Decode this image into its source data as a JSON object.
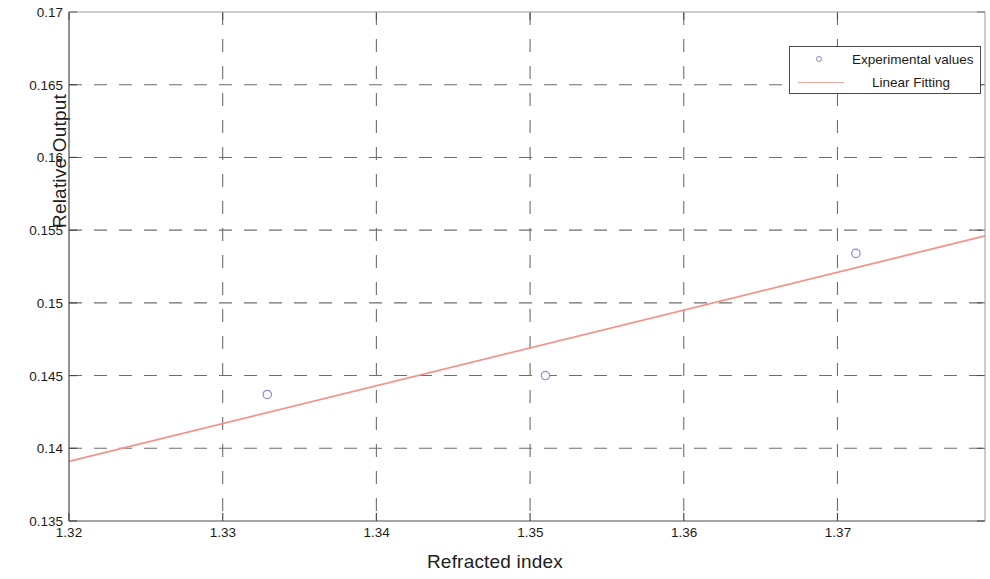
{
  "chart_data": {
    "type": "scatter",
    "title": "",
    "xlabel": "Refracted index",
    "ylabel": "Relative Output",
    "xlim": [
      1.32,
      1.3796
    ],
    "ylim": [
      0.135,
      0.17
    ],
    "grid": true,
    "grid_style": "dashed",
    "legend_position": "top-right",
    "xticks": [
      1.32,
      1.33,
      1.34,
      1.35,
      1.36,
      1.37
    ],
    "xtick_labels": [
      "1.32",
      "1.33",
      "1.34",
      "1.35",
      "1.36",
      "1.37"
    ],
    "yticks": [
      0.135,
      0.14,
      0.145,
      0.15,
      0.155,
      0.16,
      0.165,
      0.17
    ],
    "ytick_labels": [
      "0.135",
      "0.14",
      "0.145",
      "0.15",
      "0.155",
      "0.16",
      "0.165",
      "0.17"
    ],
    "series": [
      {
        "name": "Experimental values",
        "type": "scatter",
        "marker": "circle-open",
        "color": "#8a8ad0",
        "x": [
          1.3329,
          1.351,
          1.3712
        ],
        "y": [
          0.1437,
          0.145,
          0.1534
        ]
      },
      {
        "name": "Linear Fitting",
        "type": "line",
        "color": "#f3938a",
        "x": [
          1.32,
          1.3796
        ],
        "y": [
          0.1391,
          0.1546
        ]
      }
    ]
  },
  "axes": {
    "y_label": "Relative Output",
    "x_label": "Refracted index"
  },
  "legend": {
    "entries": [
      {
        "label": "Experimental values",
        "marker": "circle-open",
        "color": "#8a8ad0"
      },
      {
        "label": "Linear Fitting",
        "marker": "line",
        "color": "#f3a8a0"
      }
    ]
  },
  "colors": {
    "axis": "#4a4a4a",
    "grid": "#6e6e6e",
    "marker": "#8a8ad0",
    "fit_line": "#f3938a",
    "background": "#ffffff"
  }
}
